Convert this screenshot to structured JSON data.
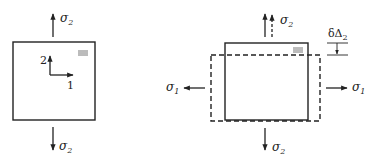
{
  "diagram": {
    "colors": {
      "stroke": "#222222",
      "background": "#ffffff"
    },
    "left_panel": {
      "top_stress_label": "σ",
      "top_stress_sub": "2",
      "bottom_stress_label": "σ",
      "bottom_stress_sub": "2",
      "axis_2_label": "2",
      "axis_1_label": "1"
    },
    "right_panel": {
      "top_stress_label": "σ",
      "top_stress_sub": "2",
      "bottom_stress_label": "σ",
      "bottom_stress_sub": "2",
      "left_stress_label": "σ",
      "left_stress_sub": "1",
      "right_stress_label": "σ",
      "right_stress_sub": "1",
      "displacement_label": "δΔ",
      "displacement_sub": "2"
    }
  }
}
